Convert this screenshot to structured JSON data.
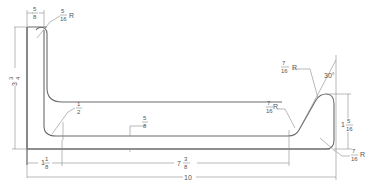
{
  "drawing": {
    "title": "Formed sheet-metal profile dimensioned drawing",
    "line_color": "#6a6a6a",
    "background": "#ffffff"
  },
  "dimensions": {
    "top_width": {
      "num": "5",
      "den": "8"
    },
    "top_radius": {
      "num": "5",
      "den": "16",
      "suffix": "R"
    },
    "left_height": {
      "whole": "3",
      "num": "3",
      "den": "4"
    },
    "inner_radius": {
      "num": "1",
      "den": "2"
    },
    "thickness": {
      "num": "5",
      "den": "8"
    },
    "left_offset": {
      "whole": "1",
      "num": "1",
      "den": "8"
    },
    "middle_length": {
      "whole": "7",
      "num": "3",
      "den": "8"
    },
    "overall_length": {
      "value": "10"
    },
    "right_radius_upper": {
      "num": "7",
      "den": "16",
      "suffix": "R"
    },
    "right_radius_lower": {
      "num": "7",
      "den": "16",
      "suffix": "R"
    },
    "angle": {
      "value": "30°"
    },
    "right_height": {
      "whole": "1",
      "num": "5",
      "den": "16"
    },
    "bottom_right_radius": {
      "num": "7",
      "den": "16",
      "suffix": "R"
    }
  }
}
